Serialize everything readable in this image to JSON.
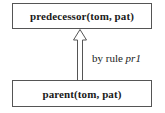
{
  "diagram": {
    "type": "derivation-tree",
    "nodes": [
      {
        "id": "conclusion",
        "text": "predecessor(tom, pat)",
        "position": "top"
      },
      {
        "id": "premise",
        "text": "parent(tom, pat)",
        "position": "bottom"
      }
    ],
    "edge": {
      "from": "premise",
      "to": "conclusion",
      "style": "hollow-double-arrow",
      "label_prefix": "by rule",
      "label_rule": "pr1"
    },
    "colors": {
      "border": "#555555",
      "text": "#1a1a1a",
      "background": "#ffffff"
    }
  }
}
